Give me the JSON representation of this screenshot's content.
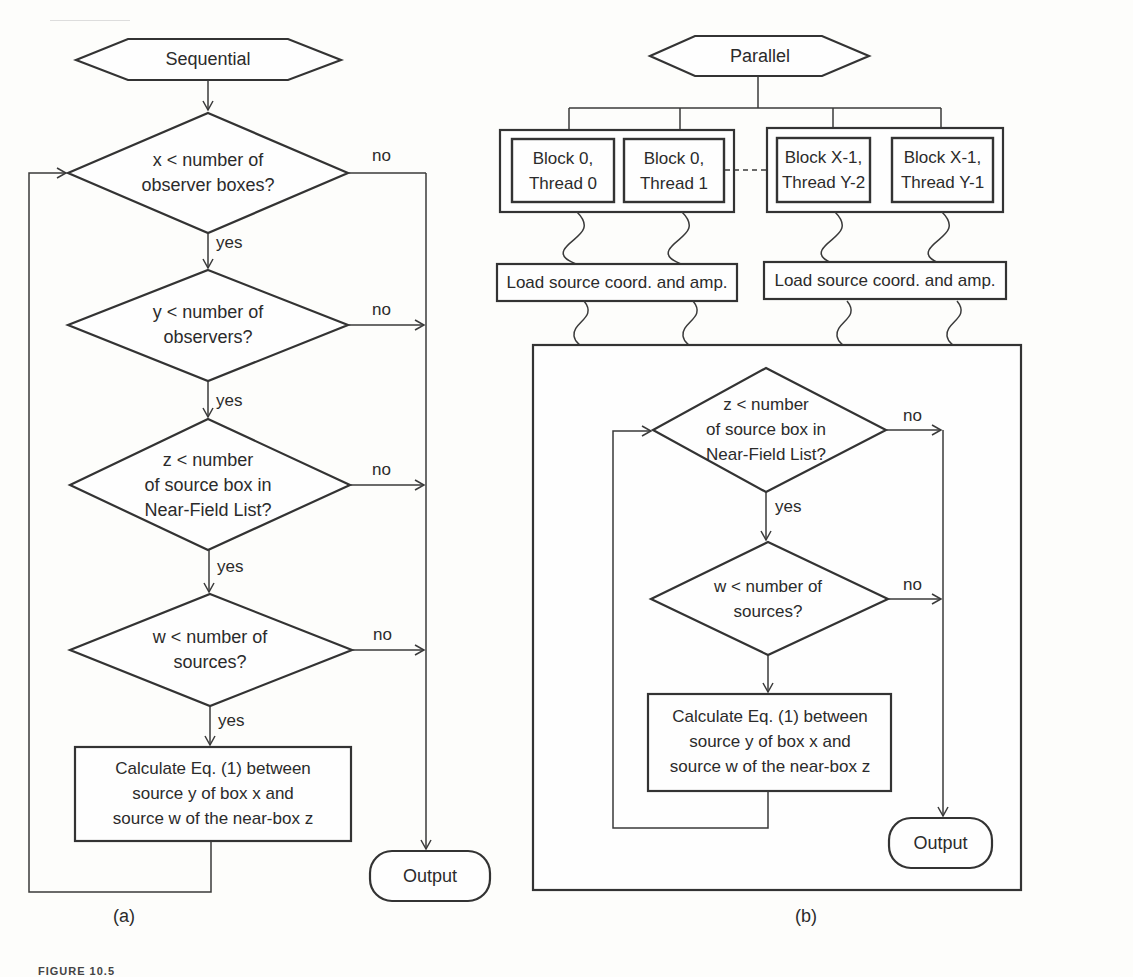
{
  "panel_a": {
    "start": "Sequential",
    "decision_x": [
      "x < number of",
      "observer boxes?"
    ],
    "decision_y": [
      "y < number of",
      "observers?"
    ],
    "decision_z": [
      "z < number",
      "of source box in",
      "Near-Field List?"
    ],
    "decision_w": [
      "w < number of",
      "sources?"
    ],
    "process": [
      "Calculate Eq. (1) between",
      "source y of box x and",
      "source w of the near-box z"
    ],
    "output": "Output",
    "yes": "yes",
    "no": "no",
    "caption": "(a)"
  },
  "panel_b": {
    "start": "Parallel",
    "threads": [
      [
        "Block 0,",
        "Thread 0"
      ],
      [
        "Block 0,",
        "Thread 1"
      ],
      [
        "Block X-1,",
        "Thread Y-2"
      ],
      [
        "Block X-1,",
        "Thread Y-1"
      ]
    ],
    "load": "Load source coord. and amp.",
    "decision_z": [
      "z < number",
      "of source box in",
      "Near-Field List?"
    ],
    "decision_w": [
      "w < number of",
      "sources?"
    ],
    "process": [
      "Calculate Eq. (1) between",
      "source y of box x and",
      "source w of the near-box z"
    ],
    "output": "Output",
    "yes": "yes",
    "no": "no",
    "caption": "(b)"
  },
  "figure_label": "FIGURE 10.5"
}
